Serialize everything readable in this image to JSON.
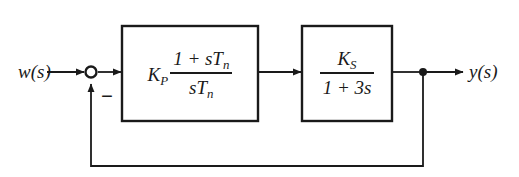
{
  "diagram": {
    "type": "control-block-diagram",
    "background_color": "#ffffff",
    "line_color": "#1a1a1a",
    "signals": {
      "input_label": "w(s)",
      "output_label": "y(s)",
      "feedback_sign": "−"
    },
    "summing_junction": {
      "name": "summing-junction",
      "shape": "circle",
      "fill": "#ffffff",
      "stroke": "#1a1a1a",
      "center_x": 91,
      "center_y": 72,
      "radius": 5.5,
      "inputs": [
        "w(s)",
        "feedback"
      ],
      "sign_label": "−"
    },
    "blocks": [
      {
        "name": "controller-block",
        "role": "controller",
        "gain": "K",
        "gain_subscript": "P",
        "numerator": "1 + sT",
        "numerator_subscript": "n",
        "denominator": "sT",
        "denominator_subscript": "n",
        "expression": "K_P (1 + sT_n)/(sT_n)",
        "x": 122,
        "y": 26,
        "width": 136,
        "height": 95
      },
      {
        "name": "plant-block",
        "role": "plant",
        "gain": "K",
        "gain_subscript": "S",
        "numerator": "K",
        "denominator": "1 + 3s",
        "expression": "K_S/(1 + 3s)",
        "x": 302,
        "y": 26,
        "width": 90,
        "height": 95
      }
    ],
    "nodes": [
      {
        "name": "output-takeoff-node",
        "shape": "filled-dot",
        "center_x": 423,
        "center_y": 72,
        "radius": 4
      }
    ],
    "connections": [
      {
        "name": "input-to-sum",
        "from": "w(s)",
        "to": "summing-junction",
        "arrow": true
      },
      {
        "name": "sum-to-controller",
        "from": "summing-junction",
        "to": "controller-block",
        "arrow": true
      },
      {
        "name": "controller-to-plant",
        "from": "controller-block",
        "to": "plant-block",
        "arrow": true
      },
      {
        "name": "plant-to-output",
        "from": "plant-block",
        "to": "y(s)",
        "arrow": true
      },
      {
        "name": "feedback-path",
        "from": "output-takeoff-node",
        "to": "summing-junction",
        "arrow": true,
        "routing": "down-left-up",
        "bottom_y": 166
      }
    ]
  }
}
